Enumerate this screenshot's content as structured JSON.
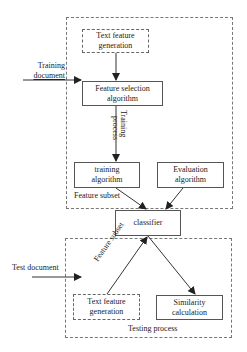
{
  "diagram": {
    "regions": {
      "training": {
        "label": "Feature subset"
      },
      "testing": {
        "label": "Testing process"
      }
    },
    "nodes": {
      "train_text_feature": {
        "label_line1": "Text feature",
        "label_line2": "generation",
        "style": "dashed"
      },
      "feature_selection": {
        "label_line1": "Feature selection",
        "label_line2": "algorithm",
        "style": "solid"
      },
      "training_algorithm": {
        "label_line1": "training",
        "label_line2": "algorithm",
        "style": "solid"
      },
      "evaluation_algorithm": {
        "label_line1": "Evaluation",
        "label_line2": "algorithm",
        "style": "solid"
      },
      "classifier": {
        "label": "classifier",
        "style": "solid"
      },
      "test_text_feature": {
        "label_line1": "Text feature",
        "label_line2": "generation",
        "style": "dashed"
      },
      "similarity": {
        "label_line1": "Similarity",
        "label_line2": "calculation",
        "style": "solid"
      }
    },
    "edge_labels": {
      "training_document_line1": "Training",
      "training_document_line2": "document",
      "training_process_line1": "Training",
      "training_process_line2": "process",
      "test_document": "Test document",
      "feature_subset_test": "Feature subset"
    },
    "edges": [
      {
        "from": "train_text_feature",
        "to": "feature_selection"
      },
      {
        "from": "training_document_input",
        "to": "feature_selection"
      },
      {
        "from": "feature_selection",
        "to": "training_algorithm"
      },
      {
        "from": "training_algorithm",
        "to": "classifier"
      },
      {
        "from": "evaluation_algorithm",
        "to": "classifier"
      },
      {
        "from": "test_document_input",
        "to": "testing_region"
      },
      {
        "from": "test_text_feature",
        "to": "classifier"
      },
      {
        "from": "classifier",
        "to": "similarity"
      }
    ],
    "colors": {
      "line": "#333333",
      "border": "#555555",
      "background": "#ffffff"
    }
  }
}
